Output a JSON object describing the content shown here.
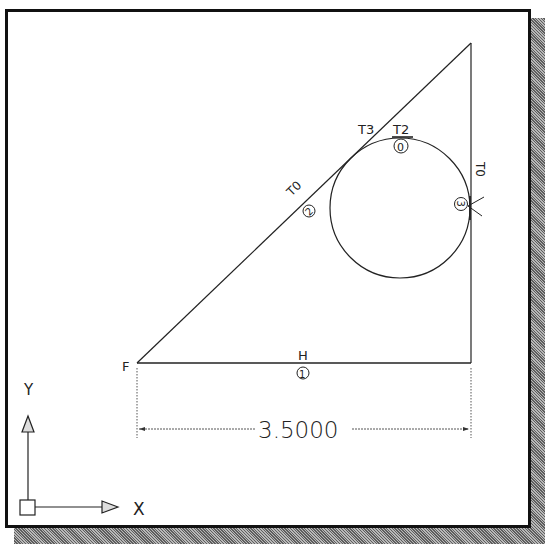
{
  "window": {
    "title": "2D sketch with constraints"
  },
  "colors": {
    "line": "#222222",
    "frame": "#111111",
    "background": "#ffffff",
    "shadow": "#8a8a8a"
  },
  "sketch": {
    "triangle": {
      "left_vertex": [
        137,
        363
      ],
      "right_vertex": [
        471,
        363
      ],
      "top_vertex": [
        471,
        43
      ]
    },
    "circle": {
      "cx": 400,
      "cy": 208,
      "r": 70
    },
    "labels": {
      "vertex_f": "F",
      "horizontal": "H",
      "horizontal_constraint_id": "1",
      "hyp_tangent": "T0",
      "hyp_constraint_id": "2",
      "t3": "T3",
      "t2": "T2",
      "top_constraint_id": "0",
      "vert_tangent": "T0",
      "vert_constraint_id": "3"
    },
    "dimension": {
      "value": "3.5000",
      "y": 429
    }
  },
  "ucs_icon": {
    "x_label": "X",
    "y_label": "Y"
  }
}
